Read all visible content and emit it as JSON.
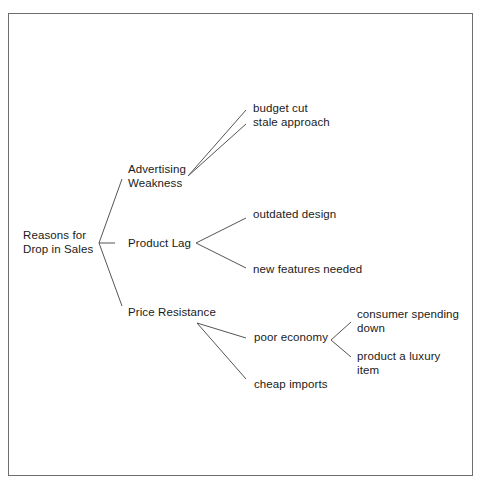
{
  "diagram": {
    "type": "tree",
    "colors": {
      "line": "#555555",
      "text": "#1a1a1a",
      "frame": "#6e6e6e",
      "background": "#ffffff"
    },
    "root": {
      "line1": "Reasons for",
      "line2": "Drop in Sales"
    },
    "branches": [
      {
        "line1": "Advertising",
        "line2": "Weakness",
        "children": [
          {
            "label": "budget cut"
          },
          {
            "label": "stale approach"
          }
        ]
      },
      {
        "label": "Product Lag",
        "children": [
          {
            "label": "outdated design"
          },
          {
            "label": "new features needed"
          }
        ]
      },
      {
        "label": "Price Resistance",
        "children": [
          {
            "label": "poor economy",
            "children": [
              {
                "line1": "consumer spending",
                "line2": "down"
              },
              {
                "line1": "product a luxury",
                "line2": "item"
              }
            ]
          },
          {
            "label": "cheap imports"
          }
        ]
      }
    ]
  }
}
